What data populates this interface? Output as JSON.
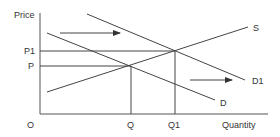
{
  "diagram": {
    "axes": {
      "y_label": "Price",
      "x_label": "Quantity",
      "origin_label": "O"
    },
    "price_levels": [
      {
        "label": "P1",
        "y": 51
      },
      {
        "label": "P",
        "y": 66
      }
    ],
    "quantity_levels": [
      {
        "label": "Q",
        "x": 131
      },
      {
        "label": "Q1",
        "x": 175
      }
    ],
    "curves": [
      {
        "label": "S",
        "name": "supply",
        "x1": 47,
        "y1": 92,
        "x2": 248,
        "y2": 27
      },
      {
        "label": "D",
        "name": "demand",
        "x1": 47,
        "y1": 33,
        "x2": 215,
        "y2": 100
      },
      {
        "label": "D1",
        "name": "demand-shifted",
        "x1": 87,
        "y1": 14,
        "x2": 245,
        "y2": 80
      }
    ],
    "arrows": [
      {
        "name": "shift-arrow-top",
        "x1": 60,
        "y1": 33,
        "x2": 120,
        "y2": 33
      },
      {
        "name": "shift-arrow-bottom",
        "x1": 190,
        "y1": 80,
        "x2": 232,
        "y2": 80
      }
    ],
    "colors": {
      "line": "#444444",
      "text": "#333333",
      "background": "#ffffff"
    }
  }
}
